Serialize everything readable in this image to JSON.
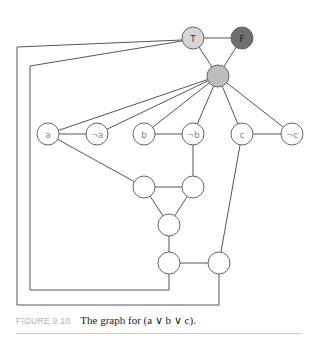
{
  "figure": {
    "label": "FIGURE 9.10",
    "caption": "The graph for (a ∨ b ∨ c)."
  },
  "colors": {
    "true_node": "#d6d6d6",
    "false_node": "#6f6f6f",
    "base_node": "#bdbdbd",
    "plain_node": "#ffffff",
    "edge": "#555555"
  },
  "nodes": [
    {
      "id": "T",
      "label": "T",
      "x": 193,
      "y": 38,
      "fill": "true_node"
    },
    {
      "id": "F",
      "label": "F",
      "x": 242,
      "y": 38,
      "fill": "false_node"
    },
    {
      "id": "B",
      "label": "",
      "x": 218,
      "y": 76,
      "fill": "base_node"
    },
    {
      "id": "a",
      "label": "a",
      "x": 48,
      "y": 134
    },
    {
      "id": "na",
      "label": "¬a",
      "x": 97,
      "y": 134
    },
    {
      "id": "b",
      "label": "b",
      "x": 144,
      "y": 134
    },
    {
      "id": "nb",
      "label": "¬b",
      "x": 193,
      "y": 134
    },
    {
      "id": "c",
      "label": "c",
      "x": 242,
      "y": 134
    },
    {
      "id": "nc",
      "label": "¬c",
      "x": 292,
      "y": 134
    },
    {
      "id": "g1",
      "label": "",
      "x": 144,
      "y": 187
    },
    {
      "id": "g2",
      "label": "",
      "x": 193,
      "y": 187
    },
    {
      "id": "g3",
      "label": "",
      "x": 169,
      "y": 225
    },
    {
      "id": "g4",
      "label": "",
      "x": 169,
      "y": 263
    },
    {
      "id": "g5",
      "label": "",
      "x": 219,
      "y": 263
    }
  ],
  "edges": [
    [
      "T",
      "F"
    ],
    [
      "T",
      "B"
    ],
    [
      "F",
      "B"
    ],
    [
      "B",
      "a"
    ],
    [
      "B",
      "na"
    ],
    [
      "B",
      "b"
    ],
    [
      "B",
      "nb"
    ],
    [
      "B",
      "c"
    ],
    [
      "B",
      "nc"
    ],
    [
      "a",
      "na"
    ],
    [
      "b",
      "nb"
    ],
    [
      "c",
      "nc"
    ],
    [
      "a",
      "g1"
    ],
    [
      "nb",
      "g2"
    ],
    [
      "g1",
      "g2"
    ],
    [
      "g1",
      "g3"
    ],
    [
      "g2",
      "g3"
    ],
    [
      "g3",
      "g4"
    ],
    [
      "g4",
      "g5"
    ],
    [
      "c",
      "g5"
    ]
  ],
  "polylines": [
    {
      "name": "T-to-g5-outer",
      "points": [
        [
          182,
          40
        ],
        [
          17,
          47
        ],
        [
          17,
          305
        ],
        [
          219,
          305
        ],
        [
          219,
          274
        ]
      ]
    },
    {
      "name": "T-to-g4-inner",
      "points": [
        [
          182,
          41
        ],
        [
          30,
          66
        ],
        [
          30,
          290
        ],
        [
          169,
          290
        ],
        [
          169,
          274
        ]
      ]
    }
  ]
}
